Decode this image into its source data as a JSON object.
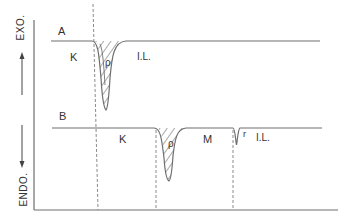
{
  "axes": {
    "exo_label": "EXO.",
    "endo_label": "ENDO."
  },
  "curve_a": {
    "label": "A",
    "regions": [
      "K",
      "I.L."
    ],
    "peak_symbol": "ρ"
  },
  "curve_b": {
    "label": "B",
    "regions": [
      "K",
      "M",
      "I.L."
    ],
    "peak_symbol": "ρ",
    "small_peak_symbol": "r"
  },
  "colors": {
    "line": "#6e6e6e",
    "dashed": "#8a8a8a",
    "text": "#333333"
  }
}
